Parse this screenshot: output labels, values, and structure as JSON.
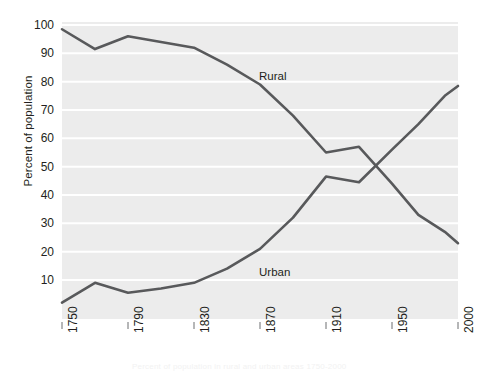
{
  "chart_data": {
    "type": "line",
    "title": "",
    "xlabel": "",
    "ylabel": "Percent of population",
    "xlim": [
      1750,
      2000
    ],
    "ylim": [
      0,
      100
    ],
    "grid": true,
    "legend_position": "inline-annotation",
    "xticklabels": [
      "1750",
      "1790",
      "1830",
      "1870",
      "1910",
      "1950",
      "2000"
    ],
    "xtickvalues": [
      1750,
      1790,
      1830,
      1870,
      1910,
      1950,
      2000
    ],
    "yticklabels": [
      "10",
      "20",
      "30",
      "40",
      "50",
      "60",
      "70",
      "80",
      "90",
      "100"
    ],
    "ytickvalues": [
      10,
      20,
      30,
      40,
      50,
      60,
      70,
      80,
      90,
      100
    ],
    "series": [
      {
        "name": "Rural",
        "color": "#58595b",
        "x": [
          1750,
          1770,
          1790,
          1810,
          1830,
          1850,
          1870,
          1890,
          1910,
          1930,
          1950,
          1970,
          1990,
          2000
        ],
        "values": [
          98.5,
          91.5,
          96,
          94,
          92,
          86,
          79,
          68,
          55,
          57,
          44,
          33,
          27,
          23
        ]
      },
      {
        "name": "Urban",
        "color": "#58595b",
        "x": [
          1750,
          1770,
          1790,
          1810,
          1830,
          1850,
          1870,
          1890,
          1910,
          1930,
          1950,
          1970,
          1990,
          2000
        ],
        "values": [
          2,
          9,
          5.5,
          7,
          9,
          14,
          21,
          32,
          46.5,
          44.5,
          56,
          65,
          75,
          78.5
        ]
      }
    ],
    "annotations": [
      {
        "text": "Rural",
        "x": 1870,
        "y": 82
      },
      {
        "text": "Urban",
        "x": 1870,
        "y": 13
      }
    ]
  },
  "style": {
    "plot_background": "#ececec",
    "gridline_color": "#ffffff",
    "line_color": "#58595b",
    "text_color": "#231f20",
    "page_background": "#ffffff"
  },
  "footnote": {
    "text": "Percent of population in rural and urban areas 1750-2000"
  }
}
